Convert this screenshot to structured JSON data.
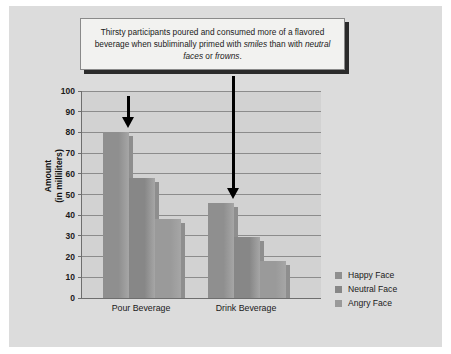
{
  "figure": {
    "caption": {
      "segments": [
        {
          "text": "Thirsty participants poured and consumed more of a flavored beverage when subliminally primed with ",
          "italic": false
        },
        {
          "text": "smiles",
          "italic": true
        },
        {
          "text": " than with ",
          "italic": false
        },
        {
          "text": "neutral faces",
          "italic": true
        },
        {
          "text": " or ",
          "italic": false
        },
        {
          "text": "frowns",
          "italic": true
        },
        {
          "text": ".",
          "italic": false
        }
      ],
      "plain": "Thirsty participants poured and consumed more of a flavored beverage when subliminally primed with smiles than with neutral faces or frowns."
    },
    "background_color": "#dcdcdc",
    "plot_background_color": "#d2d2d2"
  },
  "annotations": [
    {
      "name": "arrow-pour-happy",
      "points_to": "Pour Beverage / Happy Face",
      "color": "#000000"
    },
    {
      "name": "arrow-drink-happy",
      "points_to": "Drink Beverage / Happy Face",
      "color": "#000000"
    }
  ],
  "chart_data": {
    "type": "bar",
    "title": "",
    "xlabel": "",
    "ylabel": "Amount",
    "ylabel_sub": "(in milliliters)",
    "categories": [
      "Pour Beverage",
      "Drink Beverage"
    ],
    "series": [
      {
        "name": "Happy Face",
        "values": [
          80,
          46
        ],
        "color": "#8f8f8f"
      },
      {
        "name": "Neutral Face",
        "values": [
          58,
          29.5
        ],
        "color": "#878787"
      },
      {
        "name": "Angry Face",
        "values": [
          38,
          18
        ],
        "color": "#9a9a9a"
      }
    ],
    "ylim": [
      0,
      100
    ],
    "yticks": [
      0,
      10,
      20,
      30,
      40,
      50,
      60,
      70,
      80,
      90,
      100
    ],
    "grid": true,
    "legend_position": "right"
  }
}
